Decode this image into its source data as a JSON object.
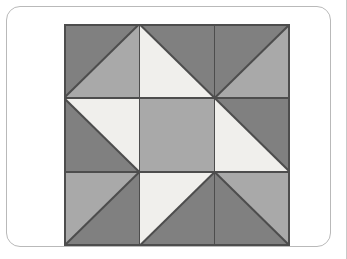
{
  "canvas": {
    "width": 347,
    "height": 259,
    "background": "#ffffff"
  },
  "card": {
    "name": "rounded-card-frame",
    "background": "#ffffff",
    "border_color": "#b9b9b9",
    "border_radius": 14,
    "x": 6,
    "y": 6,
    "width": 325,
    "height": 241
  },
  "right_edge_rule": {
    "name": "right-edge-rule",
    "color": "#c9c9c9"
  },
  "palette": {
    "dark": "#808080",
    "medium": "#a9a9a9",
    "light": "#f0efec",
    "stroke": "#4d4d4d",
    "outline": "#4d4d4d"
  },
  "quilt": {
    "name": "quilt-block",
    "title": "Quilt block pattern",
    "x": 57,
    "y": 17,
    "width": 226,
    "height": 222,
    "rows": 3,
    "cols": 3,
    "cell_width": 75.333,
    "cell_height": 74,
    "outline_width": 2,
    "grid_line_width": 1.6,
    "diagonal_line_width": 2,
    "cells": [
      {
        "id": "cell-r0-c0",
        "row": 0,
        "col": 0,
        "kind": "half-square-triangle",
        "diagonal": "anti",
        "part_a": {
          "position": "upper-left",
          "color": "#808080"
        },
        "part_b": {
          "position": "lower-right",
          "color": "#a9a9a9"
        }
      },
      {
        "id": "cell-r0-c1",
        "row": 0,
        "col": 1,
        "kind": "half-square-triangle",
        "diagonal": "main",
        "part_a": {
          "position": "upper-right",
          "color": "#808080"
        },
        "part_b": {
          "position": "lower-left",
          "color": "#f0efec"
        }
      },
      {
        "id": "cell-r0-c2",
        "row": 0,
        "col": 2,
        "kind": "half-square-triangle",
        "diagonal": "anti",
        "part_a": {
          "position": "upper-right",
          "color": "#808080"
        },
        "part_b": {
          "position": "lower-left",
          "color": "#a9a9a9"
        }
      },
      {
        "id": "cell-r1-c0",
        "row": 1,
        "col": 0,
        "kind": "half-square-triangle",
        "diagonal": "main",
        "part_a": {
          "position": "upper-right",
          "color": "#f0efec"
        },
        "part_b": {
          "position": "lower-left",
          "color": "#808080"
        }
      },
      {
        "id": "cell-r1-c1",
        "row": 1,
        "col": 1,
        "kind": "solid",
        "part_a": {
          "position": "full",
          "color": "#a9a9a9"
        },
        "part_b": null
      },
      {
        "id": "cell-r1-c2",
        "row": 1,
        "col": 2,
        "kind": "half-square-triangle",
        "diagonal": "main",
        "part_a": {
          "position": "upper-right",
          "color": "#808080"
        },
        "part_b": {
          "position": "lower-left",
          "color": "#f0efec"
        }
      },
      {
        "id": "cell-r2-c0",
        "row": 2,
        "col": 0,
        "kind": "half-square-triangle",
        "diagonal": "anti",
        "part_a": {
          "position": "upper-right",
          "color": "#a9a9a9"
        },
        "part_b": {
          "position": "lower-left",
          "color": "#808080"
        }
      },
      {
        "id": "cell-r2-c1",
        "row": 2,
        "col": 1,
        "kind": "anti",
        "diagonal": "anti",
        "part_a": {
          "position": "upper-right",
          "color": "#f0efec"
        },
        "part_b": {
          "position": "lower-left",
          "color": "#808080"
        }
      },
      {
        "id": "cell-r2-c2",
        "row": 2,
        "col": 2,
        "kind": "half-square-triangle",
        "diagonal": "main",
        "part_a": {
          "position": "upper-left",
          "color": "#a9a9a9"
        },
        "part_b": {
          "position": "lower-right",
          "color": "#808080"
        }
      }
    ]
  }
}
